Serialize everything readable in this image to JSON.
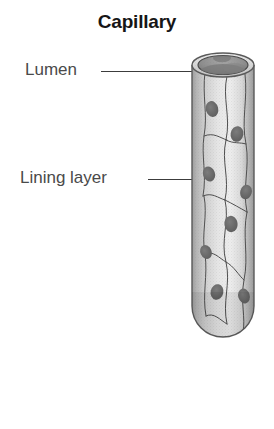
{
  "figure": {
    "title": "Capillary",
    "type": "anatomical-illustration",
    "background_color": "#ffffff",
    "style": "grayscale halftone scan"
  },
  "labels": [
    {
      "id": "lumen",
      "text": "Lumen",
      "points_to": "interior cavity at the open top of the vessel",
      "leader_line": true
    },
    {
      "id": "lining_layer",
      "text": "Lining layer",
      "points_to": "endothelial cell wall of the vessel",
      "leader_line": true
    }
  ],
  "colors": {
    "title_text": "#161616",
    "label_text": "#4a4a4a",
    "leader_line": "#3c3c3c",
    "wall_light": "#e8e8e8",
    "wall_mid": "#c6c6c6",
    "wall_dark": "#9a9a9a",
    "outline": "#555555",
    "lumen_cavity": "#8e8e8e",
    "nucleus": "#6b6b6b"
  },
  "illustration": {
    "vessel_shape": "cylindrical tube with elliptical open top and rounded bottom",
    "open_top": {
      "rim": "ellipse",
      "cavity": "dark ellipse inset within rim"
    },
    "cell_nuclei_count": 8,
    "cell_boundaries": "irregular curved lines dividing the wall into endothelial cells"
  }
}
